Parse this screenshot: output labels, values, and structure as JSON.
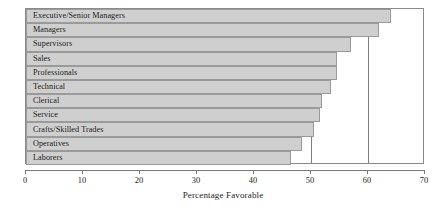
{
  "chart_data": {
    "type": "bar",
    "orientation": "horizontal",
    "title": "",
    "subtitle": "",
    "xlabel": "Percentage Favorable",
    "ylabel": "",
    "xlim": [
      0,
      70
    ],
    "xticks": [
      0,
      10,
      20,
      30,
      40,
      50,
      60,
      70
    ],
    "grid": true,
    "gridlines_x": [
      50,
      60
    ],
    "legend": null,
    "categories": [
      "Executive/Senior Managers",
      "Managers",
      "Supervisors",
      "Sales",
      "Professionals",
      "Technical",
      "Clerical",
      "Service",
      "Crafts/Skilled Trades",
      "Operatives",
      "Laborers"
    ],
    "values": [
      64,
      62,
      57,
      54.5,
      54.5,
      53.5,
      52,
      51.5,
      50.5,
      48.5,
      46.5
    ],
    "bar_color": "#cfcfcf",
    "bar_border_color": "#9a9a9a",
    "axis_color": "#7b7b7b",
    "text_color": "#1c1c1c"
  },
  "axis": {
    "tick_labels": [
      "0",
      "10",
      "20",
      "30",
      "40",
      "50",
      "60",
      "70"
    ],
    "title": "Percentage Favorable"
  }
}
